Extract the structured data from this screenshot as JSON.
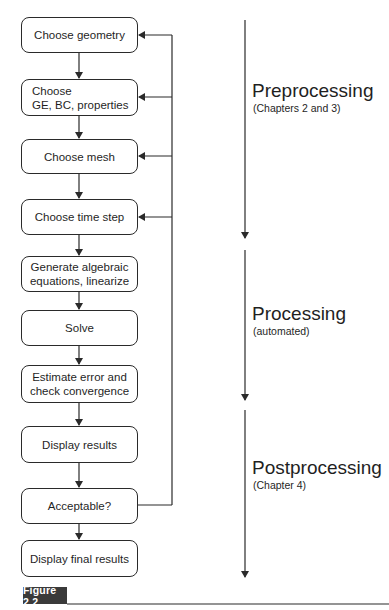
{
  "figure": {
    "label": "Figure 2.2"
  },
  "flowchart": {
    "steps": [
      {
        "label": "Choose geometry"
      },
      {
        "label": "Choose\nGE, BC, properties"
      },
      {
        "label": "Choose mesh"
      },
      {
        "label": "Choose time step"
      },
      {
        "label": "Generate algebraic\nequations, linearize"
      },
      {
        "label": "Solve"
      },
      {
        "label": "Estimate error and\ncheck convergence"
      },
      {
        "label": "Display results"
      },
      {
        "label": "Acceptable?"
      },
      {
        "label": "Display final results"
      }
    ],
    "feedback_from": "Acceptable?",
    "feedback_to": [
      "Choose geometry",
      "Choose\nGE, BC, properties",
      "Choose mesh",
      "Choose time step"
    ]
  },
  "phases": [
    {
      "title": "Preprocessing",
      "subtitle": "(Chapters 2 and 3)"
    },
    {
      "title": "Processing",
      "subtitle": "(automated)"
    },
    {
      "title": "Postprocessing",
      "subtitle": "(Chapter 4)"
    }
  ],
  "colors": {
    "line": "#2a2a2a",
    "badge_bg": "#3a3a3a",
    "badge_text": "#ffffff"
  }
}
